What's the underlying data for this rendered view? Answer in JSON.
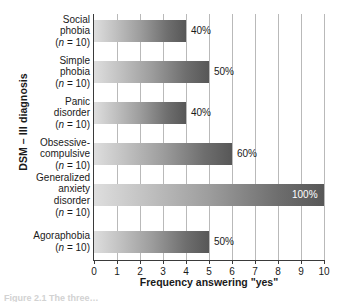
{
  "chart_data": {
    "type": "bar",
    "orientation": "horizontal",
    "title": "",
    "xlabel": "Frequency answering \"yes\"",
    "ylabel": "DSM – III diagnosis",
    "xlim": [
      0,
      10
    ],
    "xticks": [
      "0",
      "1",
      "2",
      "3",
      "4",
      "5",
      "6",
      "7",
      "8",
      "9",
      "10"
    ],
    "grid": "vertical gridlines at each integer tick",
    "legend": "none",
    "categories": [
      "Social phobia (n = 10)",
      "Simple phobia (n = 10)",
      "Panic disorder (n = 10)",
      "Obsessive-compulsive (n = 10)",
      "Generalized anxiety disorder (n = 10)",
      "Agoraphobia (n = 10)"
    ],
    "values": [
      4,
      5,
      4,
      6,
      10,
      5
    ],
    "data_labels": [
      "40%",
      "50%",
      "40%",
      "60%",
      "100%",
      "50%"
    ],
    "bars": [
      {
        "name": "Social phobia",
        "label_lines": [
          "Social",
          "phobia"
        ],
        "n_text": "(n = 10)",
        "value": 4,
        "data_label": "40%",
        "label_inside": false
      },
      {
        "name": "Simple phobia",
        "label_lines": [
          "Simple",
          "phobia"
        ],
        "n_text": "(n = 10)",
        "value": 5,
        "data_label": "50%",
        "label_inside": false
      },
      {
        "name": "Panic disorder",
        "label_lines": [
          "Panic",
          "disorder"
        ],
        "n_text": "(n = 10)",
        "value": 4,
        "data_label": "40%",
        "label_inside": false
      },
      {
        "name": "Obsessive-compulsive",
        "label_lines": [
          "Obsessive-",
          "compulsive"
        ],
        "n_text": "(n = 10)",
        "value": 6,
        "data_label": "60%",
        "label_inside": false
      },
      {
        "name": "Generalized anxiety disorder",
        "label_lines": [
          "Generalized",
          "anxiety",
          "disorder"
        ],
        "n_text": "(n = 10)",
        "value": 10,
        "data_label": "100%",
        "label_inside": true
      },
      {
        "name": "Agoraphobia",
        "label_lines": [
          "Agoraphobia"
        ],
        "n_text": "(n = 10)",
        "value": 5,
        "data_label": "50%",
        "label_inside": false
      }
    ],
    "colors": {
      "bar_gradient_start": "#dedede",
      "bar_gradient_end": "#575757",
      "axis": "#3a3a3a",
      "gridline": "#b9b9b9",
      "text": "#1a1a1a",
      "inside_label_text": "#ffffff",
      "background": "#ffffff"
    }
  },
  "caption": {
    "cropped_text": "Figure 2.1  The three…"
  }
}
